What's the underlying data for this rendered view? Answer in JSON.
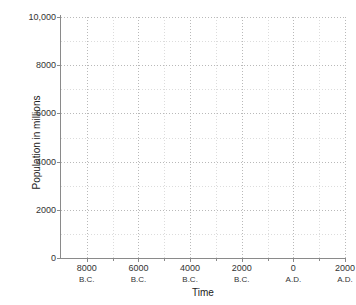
{
  "chart_data": {
    "type": "line",
    "title": "",
    "xlabel": "Time",
    "ylabel": "Population in millions",
    "xlim": [
      -9000,
      2000
    ],
    "ylim": [
      0,
      10000
    ],
    "grid": true,
    "legend": null,
    "series": [],
    "x_major_ticks": [
      {
        "value": -8000,
        "number": "8000",
        "era": "B.C."
      },
      {
        "value": -6000,
        "number": "6000",
        "era": "B.C."
      },
      {
        "value": -4000,
        "number": "4000",
        "era": "B.C."
      },
      {
        "value": -2000,
        "number": "2000",
        "era": "B.C."
      },
      {
        "value": 0,
        "number": "0",
        "era": "A.D."
      },
      {
        "value": 2000,
        "number": "2000",
        "era": "A.D."
      }
    ],
    "x_minor_ticks": [
      -7000,
      -5000,
      -3000,
      -1000,
      1000
    ],
    "y_major_ticks": [
      {
        "value": 0,
        "label": "0"
      },
      {
        "value": 2000,
        "label": "2000"
      },
      {
        "value": 4000,
        "label": "4000"
      },
      {
        "value": 6000,
        "label": "6000"
      },
      {
        "value": 8000,
        "label": "8000"
      },
      {
        "value": 10000,
        "label": "10,000"
      }
    ],
    "y_minor_ticks": [
      1000,
      3000,
      5000,
      7000,
      9000
    ],
    "colors": {
      "background": "#ffffff",
      "axis": "#8a8a8a",
      "gridline_major": "#b9b9b9",
      "gridline_minor": "#dcdcdc",
      "text": "#222222"
    }
  }
}
